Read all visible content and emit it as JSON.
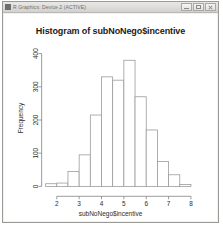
{
  "window": {
    "title": "R Graphics: Device 2 (ACTIVE)",
    "icon": "r-graphics-icon",
    "buttons": {
      "minimize": "Minimize",
      "maximize": "Maximize",
      "close": "Close"
    }
  },
  "chart_data": {
    "type": "bar",
    "title": "Histogram of subNoNego$incentive",
    "xlabel": "subNoNego$incentive",
    "ylabel": "Frequency",
    "grid": false,
    "legend": null,
    "xlim": [
      1.5,
      8.5
    ],
    "ylim": [
      0,
      400
    ],
    "xticks": [
      "2",
      "3",
      "4",
      "5",
      "6",
      "7",
      "8"
    ],
    "xtick_values": [
      2,
      3,
      4,
      5,
      6,
      7,
      8
    ],
    "yticks": [
      "0",
      "100",
      "200",
      "300",
      "400"
    ],
    "ytick_values": [
      0,
      100,
      200,
      300,
      400
    ],
    "bin_width": 0.5,
    "bin_starts": [
      1.5,
      2.0,
      2.5,
      3.0,
      3.5,
      4.0,
      4.5,
      5.0,
      5.5,
      6.0,
      6.5,
      7.0,
      7.5
    ],
    "categories": [
      "1.5-2.0",
      "2.0-2.5",
      "2.5-3.0",
      "3.0-3.5",
      "3.5-4.0",
      "4.0-4.5",
      "4.5-5.0",
      "5.0-5.5",
      "5.5-6.0",
      "6.0-6.5",
      "6.5-7.0",
      "7.0-7.5",
      "7.5-8.0"
    ],
    "values": [
      8,
      10,
      45,
      95,
      215,
      330,
      320,
      380,
      270,
      170,
      75,
      35,
      6
    ],
    "bar_fill": "#ffffff",
    "bar_stroke": "#9a9a9a",
    "axis_color": "#808080"
  }
}
